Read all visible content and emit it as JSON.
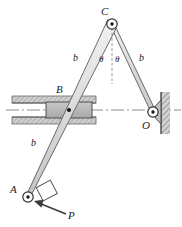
{
  "figure": {
    "background": "#ffffff",
    "width": 182,
    "height": 227,
    "colors": {
      "link_fill": "#dcdcdc",
      "link_stroke": "#6e6e6e",
      "block_fill": "#b8b8b8",
      "block_stroke": "#555555",
      "guide_fill": "#c9c9c9",
      "wall_fill": "#bdbdbd",
      "outline": "#333333",
      "centerline": "#777777",
      "arrow": "#3a3a3a",
      "text": "#1a1a1a"
    },
    "labels": [
      {
        "id": "C",
        "text": "C",
        "x": 101,
        "y": 15,
        "italic": true
      },
      {
        "id": "B",
        "text": "B",
        "x": 56,
        "y": 93,
        "italic": true
      },
      {
        "id": "O",
        "text": "O",
        "x": 142,
        "y": 129,
        "italic": true
      },
      {
        "id": "A",
        "text": "A",
        "x": 10,
        "y": 193,
        "italic": true
      },
      {
        "id": "P",
        "text": "P",
        "x": 68,
        "y": 219,
        "italic": true
      },
      {
        "id": "b-left",
        "text": "b",
        "x": 73,
        "y": 61,
        "italic": true
      },
      {
        "id": "b-right",
        "text": "b",
        "x": 139,
        "y": 61,
        "italic": true
      },
      {
        "id": "b-lower",
        "text": "b",
        "x": 31,
        "y": 146,
        "italic": true
      },
      {
        "id": "theta-left",
        "text": "θ",
        "x": 99,
        "y": 62,
        "italic": true
      },
      {
        "id": "theta-right",
        "text": "θ",
        "x": 115,
        "y": 62,
        "italic": true
      }
    ],
    "joints": [
      {
        "id": "C",
        "x": 112,
        "y": 24,
        "r": 5.2,
        "dot": 1.7
      },
      {
        "id": "B",
        "x": 69,
        "y": 110,
        "r": 0,
        "dot": 2.0
      },
      {
        "id": "O",
        "x": 153,
        "y": 112,
        "r": 5.2,
        "dot": 1.7
      },
      {
        "id": "A",
        "x": 28,
        "y": 197,
        "r": 5.2,
        "dot": 1.7
      }
    ],
    "links": [
      {
        "id": "link-AC",
        "from": "A",
        "to": "C",
        "half_width": 4.2,
        "label": "b"
      },
      {
        "id": "link-CO",
        "from": "C",
        "to": "O",
        "half_width": 4.0,
        "label": "b"
      }
    ],
    "guide": {
      "id": "horizontal-slot",
      "x": 12,
      "y": 96,
      "width": 84,
      "height": 28,
      "slot_top": 103,
      "slot_bottom": 117
    },
    "slider_block": {
      "id": "block-B",
      "x": 46,
      "y": 102,
      "width": 46,
      "height": 17
    },
    "wall": {
      "id": "fixed-wall-O",
      "x": 161,
      "y": 92,
      "width": 9,
      "height": 42
    },
    "centerline": {
      "id": "horizontal-centerline",
      "x1": 8,
      "y1": 110,
      "x2": 180,
      "y2": 110,
      "dash": "14 3 2 3"
    },
    "vertical_reference": {
      "id": "vertical-centerline",
      "x1": 112,
      "y1": 28,
      "x2": 112,
      "y2": 84,
      "dash": "3 2"
    },
    "force": {
      "id": "force-P",
      "label": "P",
      "tail_x": 66,
      "tail_y": 214,
      "head_x": 36,
      "head_y": 202
    },
    "end_block_A": {
      "id": "block-A",
      "cx": 46,
      "cy": 192,
      "size": 15,
      "rotation": -18
    }
  }
}
